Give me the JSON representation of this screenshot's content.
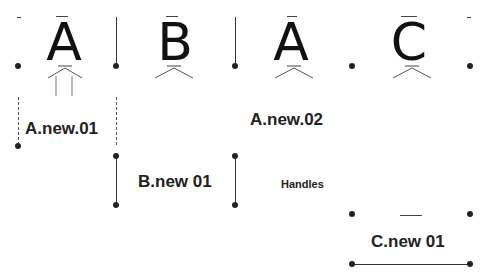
{
  "glyphs": [
    {
      "char": "A",
      "name": "glyph-a-1"
    },
    {
      "char": "B",
      "name": "glyph-b"
    },
    {
      "char": "A",
      "name": "glyph-a-2"
    },
    {
      "char": "C",
      "name": "glyph-c"
    }
  ],
  "labels": {
    "a_new_01": "A.new.01",
    "a_new_02": "A.new.02",
    "b_new_01": "B.new 01",
    "c_new_01": "C.new 01",
    "handles": "Handles"
  }
}
